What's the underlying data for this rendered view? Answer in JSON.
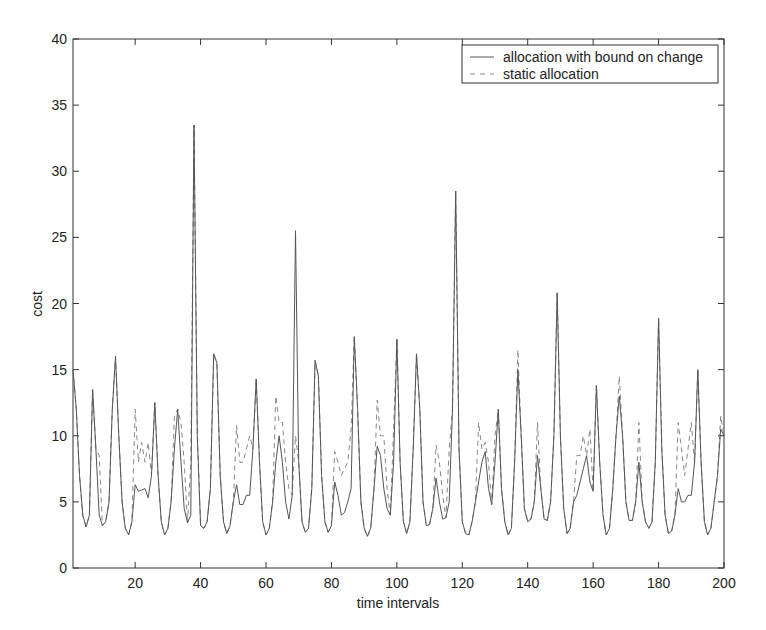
{
  "chart_data": {
    "type": "line",
    "title": "",
    "xlabel": "time intervals",
    "ylabel": "cost",
    "xlim": [
      1,
      200
    ],
    "ylim": [
      0,
      40
    ],
    "xticks": [
      20,
      40,
      60,
      80,
      100,
      120,
      140,
      160,
      180,
      200
    ],
    "yticks": [
      0,
      5,
      10,
      15,
      20,
      25,
      30,
      35,
      40
    ],
    "grid": false,
    "legend_position": "upper right",
    "x_start": 1,
    "series": [
      {
        "name": "allocation with bound on change",
        "style": "solid",
        "color": "#555555",
        "values": [
          15,
          12,
          7,
          4,
          3.1,
          4,
          13.5,
          9,
          4,
          3.2,
          3.5,
          5,
          12,
          16,
          10,
          5,
          3,
          2.5,
          3.5,
          6.3,
          5.8,
          5.9,
          6,
          5.3,
          7,
          12.5,
          7,
          3.5,
          2.5,
          3,
          5,
          9,
          12,
          8,
          4.5,
          3.4,
          4,
          33.5,
          10,
          3.2,
          3,
          3.5,
          6,
          16.2,
          15.5,
          7,
          3.5,
          2.6,
          3.2,
          5,
          6.3,
          4.8,
          4.8,
          5.5,
          5.5,
          9,
          14.3,
          8,
          3.5,
          2.5,
          3,
          5,
          8,
          10,
          8,
          5,
          3.7,
          5.5,
          25.5,
          8,
          3.5,
          2.7,
          3,
          6,
          15.7,
          14.5,
          7,
          3.5,
          2.7,
          3.2,
          6.5,
          5.5,
          4,
          4.2,
          5,
          6,
          17.5,
          12,
          5,
          3,
          2.4,
          3,
          6,
          9.2,
          8.5,
          6,
          4.5,
          4,
          8,
          17.3,
          8,
          3.5,
          2.6,
          3.5,
          9,
          16.2,
          12,
          5,
          3.2,
          3.3,
          4.5,
          6.8,
          5,
          3.7,
          3.8,
          5,
          12,
          28.5,
          9,
          3.5,
          2.6,
          2.5,
          3.5,
          5,
          6.5,
          8,
          8.8,
          6,
          4.8,
          8,
          12,
          6,
          3.5,
          2.5,
          3,
          8,
          15,
          10,
          4.5,
          3.5,
          3.7,
          5,
          8.5,
          6,
          3.7,
          3.6,
          5,
          10,
          20.8,
          10,
          4.5,
          2.6,
          3,
          5,
          5.5,
          6.5,
          7.5,
          8.5,
          6.5,
          5.8,
          13.8,
          8,
          4,
          2.5,
          3,
          6,
          10,
          13,
          10,
          5,
          3.6,
          3.6,
          5,
          8,
          5,
          3.5,
          3,
          3.5,
          8,
          18.9,
          9,
          4,
          2.6,
          2.8,
          4,
          6,
          5,
          5,
          5.5,
          5.5,
          8,
          15,
          8,
          3.5,
          2.5,
          3,
          5,
          7,
          10.5,
          10
        ]
      },
      {
        "name": "static allocation",
        "style": "dashed",
        "color": "#888888",
        "values": [
          15,
          12,
          7,
          4,
          3.1,
          4,
          13.5,
          9,
          8.5,
          3.2,
          3.5,
          5,
          12,
          16,
          10,
          5,
          3,
          2.5,
          3.5,
          12,
          8,
          9.5,
          8,
          9.5,
          7,
          12.5,
          7,
          3.5,
          2.5,
          3,
          5,
          11.5,
          12,
          11,
          8,
          3.4,
          8,
          33.5,
          10,
          3.2,
          3,
          3.5,
          6,
          16.2,
          15.5,
          7,
          3.5,
          2.6,
          3.2,
          5,
          10.8,
          8,
          8,
          9,
          10,
          9,
          14.3,
          8,
          3.5,
          2.5,
          3,
          5,
          13,
          11,
          11,
          8,
          6,
          5.5,
          10,
          8,
          3.5,
          2.7,
          3,
          6,
          15.7,
          14.5,
          7,
          3.5,
          2.7,
          3.2,
          8.8,
          8,
          7,
          7.5,
          8,
          10.5,
          17.5,
          12,
          5,
          3,
          2.4,
          3,
          6,
          12.7,
          10,
          10,
          6,
          4,
          10.5,
          17.3,
          8,
          3.5,
          2.6,
          3.5,
          9,
          16.2,
          12,
          5,
          3.2,
          3.3,
          4.5,
          9.3,
          8,
          5.5,
          3.8,
          9,
          12,
          28.5,
          9,
          3.5,
          2.6,
          2.5,
          3.5,
          5,
          11,
          9,
          9.5,
          8,
          4.8,
          10,
          12,
          6,
          3.5,
          2.5,
          3,
          8,
          16.5,
          10,
          4.5,
          3.5,
          3.7,
          5,
          11,
          6,
          3.7,
          3.6,
          5,
          10,
          20.8,
          10,
          4.5,
          2.6,
          3,
          5,
          8.5,
          8.5,
          10,
          8.5,
          10.5,
          5.8,
          13.8,
          8,
          4,
          2.5,
          3,
          6,
          10,
          14.5,
          10,
          5,
          3.6,
          3.6,
          5,
          11,
          5,
          3.5,
          3,
          3.5,
          8,
          18.9,
          9,
          4,
          2.6,
          2.8,
          4,
          11,
          9,
          7,
          9,
          11,
          8,
          15,
          8,
          3.5,
          2.5,
          3,
          5,
          7,
          11.5,
          10
        ]
      }
    ]
  },
  "legend": {
    "items": [
      {
        "label": "allocation with bound on change",
        "style": "solid"
      },
      {
        "label": "static allocation",
        "style": "dashed"
      }
    ]
  }
}
